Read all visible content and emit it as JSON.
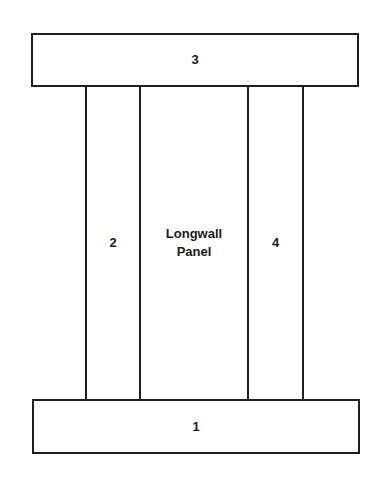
{
  "diagram": {
    "type": "mine-layout",
    "regions": {
      "top": {
        "label": "3"
      },
      "left_pillar": {
        "label": "2"
      },
      "panel": {
        "line1": "Longwall",
        "line2": "Panel"
      },
      "right_pillar": {
        "label": "4"
      },
      "bottom": {
        "label": "1"
      }
    },
    "stroke_color": "#1e1e1e",
    "background_color": "#ffffff"
  }
}
